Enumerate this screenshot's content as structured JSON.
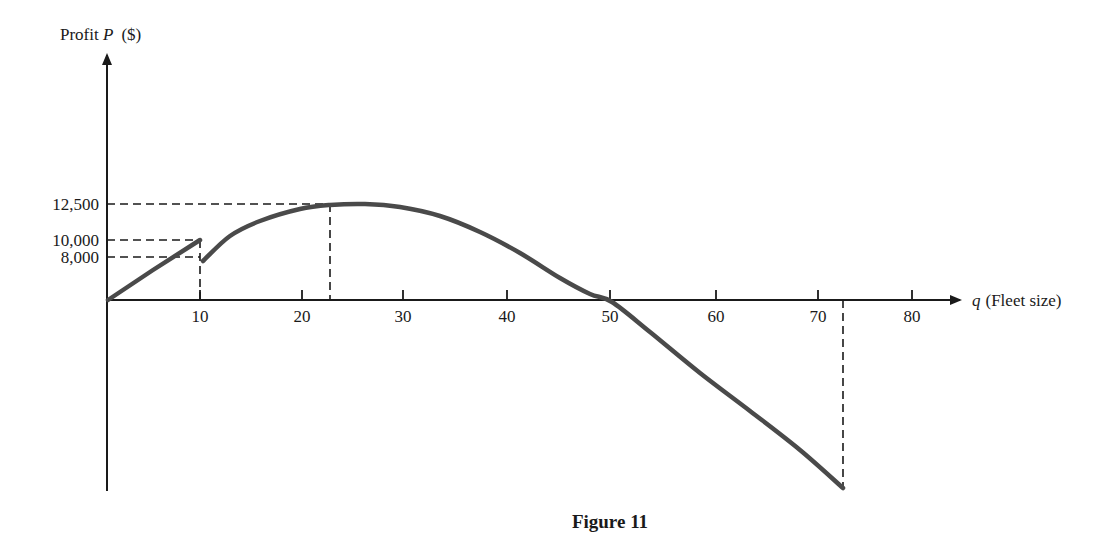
{
  "caption": "Figure 11",
  "y_axis": {
    "label_prefix": "Profit ",
    "label_var": "P",
    "label_unit": "($)"
  },
  "x_axis": {
    "label_var": "q",
    "label_text": "(Fleet size)"
  },
  "colors": {
    "axis": "#1a1a1a",
    "curve": "#4a4a4a",
    "background": "#ffffff"
  },
  "chart_data": {
    "type": "line",
    "title": "Figure 11",
    "xlabel": "q (Fleet size)",
    "ylabel": "Profit P ($)",
    "x_ticks": [
      10,
      20,
      30,
      40,
      50,
      60,
      70,
      80
    ],
    "y_ticks": [
      8000,
      10000,
      12500
    ],
    "y_tick_labels": [
      "8,000",
      "10,000",
      "12,500"
    ],
    "xlim": [
      0,
      85
    ],
    "grid": false,
    "legend": null,
    "series": [
      {
        "name": "Profit segment 1 (0 ≤ q ≤ 10)",
        "x": [
          0,
          5,
          10
        ],
        "y": [
          0,
          5000,
          10000
        ]
      },
      {
        "name": "Profit segment 2 (10 < q ≤ 72.5)",
        "x": [
          10,
          15,
          20,
          22.5,
          25,
          30,
          35,
          40,
          45,
          51.5,
          55,
          60,
          65,
          70,
          72.5
        ],
        "y": [
          8000,
          10600,
          12100,
          12500,
          12500,
          12100,
          11100,
          9200,
          6300,
          0,
          -3600,
          -9200,
          -15000,
          -21000,
          -24500
        ]
      }
    ],
    "annotations": [
      {
        "type": "dashed-guide",
        "x": 10,
        "y": 10000,
        "note": "end of first segment"
      },
      {
        "type": "dashed-guide",
        "x": 10,
        "y": 8000,
        "note": "start of second segment"
      },
      {
        "type": "dashed-guide",
        "x": 22.5,
        "y": 12500,
        "note": "maximum profit"
      },
      {
        "type": "dashed-guide",
        "x": 72.5,
        "y": -24500,
        "note": "end of domain"
      }
    ]
  },
  "layout": {
    "origin": [
      107,
      300
    ],
    "y_axis_top": 55,
    "y_axis_bottom": 491,
    "x_axis_right": 960,
    "x_tick_px": [
      200,
      302,
      403,
      507,
      610,
      716,
      818,
      912
    ],
    "y_tick_px": [
      257,
      240,
      204
    ],
    "segment1_px": [
      [
        108,
        300
      ],
      [
        153,
        270
      ],
      [
        200,
        240
      ]
    ],
    "segment2_px": [
      [
        203,
        261
      ],
      [
        230,
        236
      ],
      [
        260,
        221
      ],
      [
        300,
        209
      ],
      [
        330,
        205
      ],
      [
        365,
        204
      ],
      [
        400,
        207
      ],
      [
        440,
        216
      ],
      [
        480,
        232
      ],
      [
        520,
        253
      ],
      [
        560,
        278
      ],
      [
        590,
        294
      ],
      [
        612,
        302
      ],
      [
        650,
        332
      ],
      [
        700,
        373
      ],
      [
        750,
        411
      ],
      [
        800,
        450
      ],
      [
        843,
        488
      ]
    ],
    "peak_guide_x": 330,
    "end_guide_x": 843,
    "end_guide_y": 488
  }
}
